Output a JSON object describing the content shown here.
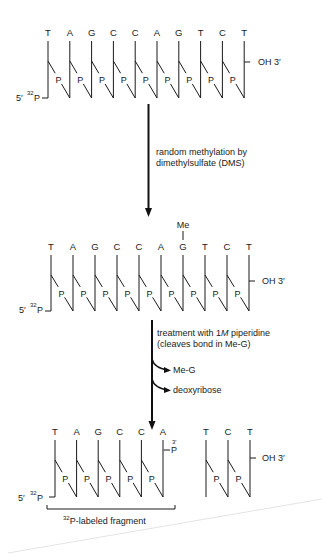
{
  "diagram": {
    "colors": {
      "ink": "#1a1a1a",
      "arrow": "#111111",
      "background": "#ffffff"
    },
    "strand1": {
      "bases": [
        "T",
        "A",
        "G",
        "C",
        "C",
        "A",
        "G",
        "T",
        "C",
        "T"
      ],
      "phosphate_label": "P",
      "five_prime_label": "5′",
      "isotope_sup": "32",
      "isotope_P": "P",
      "three_prime_label": "OH 3′"
    },
    "step1": {
      "line1": "random methylation by",
      "line2": "dimethylsulfate (DMS)"
    },
    "strand2": {
      "bases": [
        "T",
        "A",
        "G",
        "C",
        "C",
        "A",
        "G",
        "T",
        "C",
        "T"
      ],
      "modification_label": "Me",
      "modified_index": 6,
      "phosphate_label": "P",
      "five_prime_label": "5′",
      "isotope_sup": "32",
      "isotope_P": "P",
      "three_prime_label": "OH 3′"
    },
    "step2": {
      "line1_a": "treatment with 1",
      "line1_italic": "M",
      "line1_b": " piperidine",
      "line2": "(cleaves bond in Me-G)",
      "released": [
        "Me-G",
        "deoxyribose"
      ]
    },
    "fragment_left": {
      "bases": [
        "T",
        "A",
        "G",
        "C",
        "C",
        "A"
      ],
      "phosphate_label": "P",
      "five_prime_label": "5′",
      "isotope_sup": "32",
      "isotope_P": "P",
      "three_prime_end_sup": "3′",
      "three_prime_end_P": "P"
    },
    "fragment_right": {
      "bases": [
        "T",
        "C",
        "T"
      ],
      "phosphate_label": "P",
      "three_prime_label": "OH 3′"
    },
    "fragment_caption": {
      "sup": "32",
      "text": "P-labeled fragment"
    }
  }
}
